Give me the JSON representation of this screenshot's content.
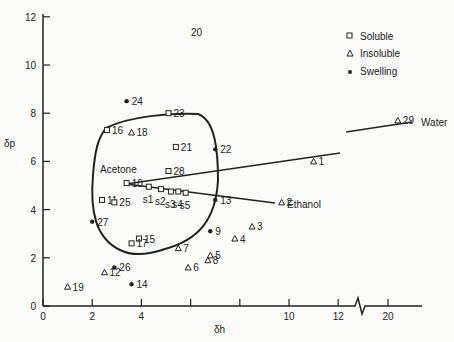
{
  "chart_data": {
    "type": "scatter",
    "title": "",
    "xlabel": "δh",
    "ylabel": "δp",
    "xlim": [
      0,
      21
    ],
    "ylim": [
      0,
      12
    ],
    "x_ticks": [
      "0",
      "2",
      "4",
      "",
      "",
      "10",
      "12",
      "20"
    ],
    "x_tick_values": [
      0,
      2,
      4,
      6,
      8,
      10,
      12,
      20
    ],
    "y_ticks": [
      "0",
      "2",
      "4",
      "6",
      "8",
      "10",
      "12"
    ],
    "x_axis_break": "between 12 and 20",
    "grid": false,
    "legend": [
      {
        "marker": "square-open",
        "label": "Soluble"
      },
      {
        "marker": "triangle-open",
        "label": "Insoluble"
      },
      {
        "marker": "dot-filled",
        "label": "Swelling"
      }
    ],
    "legend_position": "upper right",
    "points": [
      {
        "id": "1",
        "x": 11.0,
        "y": 6.0,
        "class": "Insoluble"
      },
      {
        "id": "2",
        "x": 9.7,
        "y": 4.3,
        "class": "Insoluble",
        "label": "Ethanol"
      },
      {
        "id": "3",
        "x": 8.5,
        "y": 3.3,
        "class": "Insoluble"
      },
      {
        "id": "4",
        "x": 7.8,
        "y": 2.8,
        "class": "Insoluble"
      },
      {
        "id": "5",
        "x": 6.8,
        "y": 2.1,
        "class": "Insoluble"
      },
      {
        "id": "6",
        "x": 5.9,
        "y": 1.6,
        "class": "Insoluble"
      },
      {
        "id": "7",
        "x": 5.5,
        "y": 2.4,
        "class": "Insoluble"
      },
      {
        "id": "8",
        "x": 6.7,
        "y": 1.9,
        "class": "Insoluble"
      },
      {
        "id": "9",
        "x": 6.8,
        "y": 3.1,
        "class": "Swelling"
      },
      {
        "id": "10",
        "x": 3.4,
        "y": 5.1,
        "class": "Soluble"
      },
      {
        "id": "11",
        "x": 2.4,
        "y": 4.4,
        "class": "Soluble"
      },
      {
        "id": "12",
        "x": 2.5,
        "y": 1.4,
        "class": "Insoluble"
      },
      {
        "id": "13",
        "x": 7.0,
        "y": 4.4,
        "class": "Swelling"
      },
      {
        "id": "14",
        "x": 3.6,
        "y": 0.9,
        "class": "Swelling"
      },
      {
        "id": "15",
        "x": 3.9,
        "y": 2.8,
        "class": "Soluble"
      },
      {
        "id": "16",
        "x": 2.6,
        "y": 7.3,
        "class": "Soluble"
      },
      {
        "id": "17",
        "x": 3.6,
        "y": 2.6,
        "class": "Soluble"
      },
      {
        "id": "18",
        "x": 3.6,
        "y": 7.2,
        "class": "Insoluble"
      },
      {
        "id": "19",
        "x": 1.0,
        "y": 0.8,
        "class": "Insoluble"
      },
      {
        "id": "20",
        "x": null,
        "y": null,
        "class": "label only",
        "note": "label shown near (6.5,12)"
      },
      {
        "id": "21",
        "x": 5.4,
        "y": 6.6,
        "class": "Soluble"
      },
      {
        "id": "22",
        "x": 7.0,
        "y": 6.5,
        "class": "Swelling"
      },
      {
        "id": "23",
        "x": 5.1,
        "y": 8.0,
        "class": "Soluble"
      },
      {
        "id": "24",
        "x": 3.4,
        "y": 8.5,
        "class": "Swelling"
      },
      {
        "id": "25",
        "x": 2.9,
        "y": 4.3,
        "class": "Soluble"
      },
      {
        "id": "26",
        "x": 2.9,
        "y": 1.6,
        "class": "Swelling"
      },
      {
        "id": "27",
        "x": 2.0,
        "y": 3.5,
        "class": "Swelling"
      },
      {
        "id": "28",
        "x": 5.1,
        "y": 5.6,
        "class": "Soluble",
        "label": "Acetone"
      },
      {
        "id": "29",
        "x": 20.4,
        "y": 7.7,
        "class": "Insoluble",
        "label": "Water"
      },
      {
        "id": "s1",
        "x": 4.3,
        "y": 4.95,
        "class": "Soluble"
      },
      {
        "id": "s2",
        "x": 4.8,
        "y": 4.85,
        "class": "Soluble"
      },
      {
        "id": "s3",
        "x": 5.2,
        "y": 4.75,
        "class": "Soluble"
      },
      {
        "id": "s4",
        "x": 5.5,
        "y": 4.75,
        "class": "Soluble"
      },
      {
        "id": "s5",
        "x": 5.8,
        "y": 4.7,
        "class": "Soluble"
      }
    ],
    "lines": [
      {
        "name": "acetone-water mixing line",
        "from": [
          3.4,
          5.1
        ],
        "to": [
          12.0,
          6.4
        ],
        "continued_from": [
          12.8,
          7.2
        ],
        "continued_to": [
          20.4,
          7.7
        ]
      },
      {
        "name": "acetone-ethanol mixing line",
        "from": [
          3.4,
          5.1
        ],
        "to": [
          9.7,
          4.3
        ]
      }
    ],
    "region": "closed solubility boundary curve enclosing soluble points"
  }
}
